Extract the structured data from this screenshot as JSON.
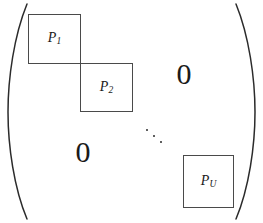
{
  "figure": {
    "type": "block-diagonal-matrix",
    "delimiters": {
      "left": "(",
      "right": ")"
    },
    "blocks": [
      {
        "id": "p1",
        "symbol": "P",
        "subscript": "1",
        "label": "P1"
      },
      {
        "id": "p2",
        "symbol": "P",
        "subscript": "2",
        "label": "P2"
      },
      {
        "id": "pu",
        "symbol": "P",
        "subscript": "U",
        "label": "PU"
      }
    ],
    "zeros": [
      {
        "id": "top-right",
        "text": "0"
      },
      {
        "id": "bottom-left",
        "text": "0"
      }
    ],
    "ellipsis": {
      "id": "ddots",
      "text": "⋱",
      "dot_count": 3,
      "direction": "diagonal-down-right"
    },
    "colors": {
      "background": "#ffffff",
      "ink": "#1a1a1a",
      "block_border": "#4a4a4a",
      "delimiter": "#2b2b2b"
    }
  }
}
